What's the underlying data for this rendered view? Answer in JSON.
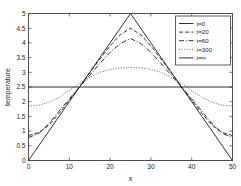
{
  "chart_data": {
    "type": "line",
    "title": "",
    "xlabel": "x",
    "ylabel": "temperature",
    "xlim": [
      0,
      50
    ],
    "ylim": [
      0,
      5
    ],
    "grid": false,
    "legend_position": "upper right",
    "xticks": [
      0,
      10,
      20,
      30,
      40,
      50
    ],
    "xtick_labels": [
      "0",
      "10",
      "20",
      "30",
      "40",
      "50"
    ],
    "yticks": [
      0,
      0.5,
      1,
      1.5,
      2,
      2.5,
      3,
      3.5,
      4,
      4.5,
      5
    ],
    "ytick_labels": [
      "0",
      "0.5",
      "1",
      "1.5",
      "2",
      "2.5",
      "3",
      "3.5",
      "4",
      "4.5",
      "5"
    ],
    "series": [
      {
        "name": "t=0",
        "style": "solid",
        "color": "#1a1a1a",
        "x": [
          0,
          2.5,
          5,
          7.5,
          10,
          12.5,
          15,
          17.5,
          20,
          22.5,
          25,
          27.5,
          30,
          32.5,
          35,
          37.5,
          40,
          42.5,
          45,
          47.5,
          50
        ],
        "y": [
          0,
          0.5,
          1.0,
          1.5,
          2.0,
          2.5,
          3.0,
          3.5,
          4.0,
          4.5,
          5.0,
          4.5,
          4.0,
          3.5,
          3.0,
          2.5,
          2.0,
          1.5,
          1.0,
          0.5,
          0
        ]
      },
      {
        "name": "t=20",
        "style": "dashed",
        "color": "#1a1a1a",
        "x": [
          0,
          2.5,
          5,
          7.5,
          10,
          12.5,
          15,
          17.5,
          20,
          22.5,
          25,
          27.5,
          30,
          32.5,
          35,
          37.5,
          40,
          42.5,
          45,
          47.5,
          50
        ],
        "y": [
          0.85,
          0.95,
          1.2,
          1.6,
          2.05,
          2.5,
          2.98,
          3.45,
          3.9,
          4.28,
          4.5,
          4.28,
          3.9,
          3.45,
          2.98,
          2.5,
          2.05,
          1.6,
          1.2,
          0.95,
          0.85
        ]
      },
      {
        "name": "t=60",
        "style": "dashdot",
        "color": "#1a1a1a",
        "x": [
          0,
          2.5,
          5,
          7.5,
          10,
          12.5,
          15,
          17.5,
          20,
          22.5,
          25,
          27.5,
          30,
          32.5,
          35,
          37.5,
          40,
          42.5,
          45,
          47.5,
          50
        ],
        "y": [
          0.78,
          0.92,
          1.25,
          1.68,
          2.1,
          2.5,
          2.9,
          3.3,
          3.68,
          3.98,
          4.15,
          3.98,
          3.68,
          3.3,
          2.9,
          2.5,
          2.1,
          1.68,
          1.25,
          0.92,
          0.78
        ]
      },
      {
        "name": "t=300",
        "style": "dotted",
        "color": "#1a1a1a",
        "x": [
          0,
          2.5,
          5,
          7.5,
          10,
          12.5,
          15,
          17.5,
          20,
          22.5,
          25,
          27.5,
          30,
          32.5,
          35,
          37.5,
          40,
          42.5,
          45,
          47.5,
          50
        ],
        "y": [
          1.85,
          1.88,
          1.98,
          2.15,
          2.38,
          2.62,
          2.82,
          3.0,
          3.1,
          3.15,
          3.16,
          3.15,
          3.1,
          3.0,
          2.82,
          2.62,
          2.38,
          2.15,
          1.98,
          1.88,
          1.85
        ]
      },
      {
        "name": "t=∞",
        "style": "solid",
        "color": "#1a1a1a",
        "x": [
          0,
          50
        ],
        "y": [
          2.5,
          2.5
        ]
      }
    ]
  }
}
